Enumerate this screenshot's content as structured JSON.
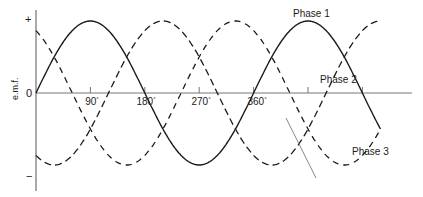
{
  "figure": {
    "y_axis_label": "e.m.f.",
    "y_signs": {
      "plus": "+",
      "zero": "0",
      "minus": "−"
    },
    "x_ticks": [
      {
        "label": "90",
        "deg": 90
      },
      {
        "label": "180",
        "deg": 180
      },
      {
        "label": "270",
        "deg": 270
      },
      {
        "label": "360",
        "deg": 360
      }
    ],
    "degree_symbol": "°",
    "phase_labels": {
      "phase1": "Phase 1",
      "phase2": "Phase 2",
      "phase3": "Phase 3"
    }
  },
  "chart_data": {
    "type": "line",
    "title": "",
    "xlabel": "",
    "ylabel": "e.m.f.",
    "x_unit": "degrees",
    "x_range": [
      0,
      570
    ],
    "y_range": [
      -1,
      1
    ],
    "x_tick_labels": [
      "90°",
      "180°",
      "270°",
      "360°"
    ],
    "y_tick_labels": [
      "+",
      "0",
      "−"
    ],
    "series": [
      {
        "name": "Phase 1",
        "function": "sin(θ)",
        "phase_shift_deg": 0,
        "style": "solid",
        "color": "#1a1a1a"
      },
      {
        "name": "Phase 2",
        "function": "sin(θ − 120°)",
        "phase_shift_deg": -120,
        "style": "dash-dot",
        "color": "#1a1a1a"
      },
      {
        "name": "Phase 3",
        "function": "sin(θ − 240°)",
        "phase_shift_deg": -240,
        "style": "dashed",
        "color": "#1a1a1a"
      }
    ],
    "grid": false,
    "legend": "inline labels near curves"
  }
}
